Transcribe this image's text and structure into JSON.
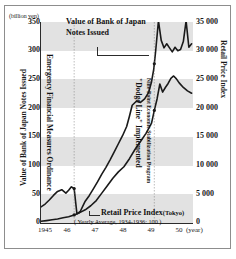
{
  "chart_data": {
    "type": "line",
    "title": "",
    "units_caption": "(billion yen)",
    "xlabel": "",
    "x_unit_label": "(year)",
    "xticks": [
      "1945",
      "46",
      "47",
      "48",
      "49",
      "50"
    ],
    "xlim": [
      1945.0,
      1950.5
    ],
    "grid": "horizontal-bands",
    "legend": "annotations-inline",
    "axes": {
      "left": {
        "title": "Value of Bank of Japan Notes Issued",
        "ticks": [
          "350",
          "300",
          "250",
          "200",
          "150",
          "100",
          "50",
          "0"
        ],
        "values": [
          350,
          300,
          250,
          200,
          150,
          100,
          50,
          0
        ],
        "lim": [
          0,
          350
        ],
        "unit": "(billion yen)"
      },
      "right": {
        "title": "Retail Price Index",
        "ticks": [
          "35 000",
          "30 000",
          "25 000",
          "20 000",
          "15 000",
          "10 000",
          "5 000",
          "0"
        ],
        "values": [
          35000,
          30000,
          25000,
          20000,
          15000,
          10000,
          5000,
          0
        ],
        "lim": [
          0,
          35000
        ]
      }
    },
    "annotations": {
      "boj_line1": "Value of Bank of Japan",
      "boj_line2": "Notes Issued",
      "emergency_ordinance": "Emergency Financial Measures Ordinance",
      "dodge_line": "\"Dodge Line\" Implemented",
      "dodge_sub": "Nine-Point Economic Stabilization Program",
      "rpi_label": "Retail Price Index",
      "rpi_city": "(Tokyo)",
      "rpi_sub": "( Yearly Average, 1934-1936: 100 )"
    },
    "series": [
      {
        "name": "Value of Bank of Japan Notes Issued",
        "axis": "left",
        "unit": "billion yen",
        "color": "#1a1a1a",
        "x": [
          1945.0,
          1945.15,
          1945.3,
          1945.45,
          1945.6,
          1945.75,
          1945.9,
          1946.0,
          1946.1,
          1946.2,
          1946.3,
          1946.42,
          1946.5,
          1946.6,
          1946.75,
          1946.9,
          1947.05,
          1947.2,
          1947.35,
          1947.5,
          1947.65,
          1947.8,
          1947.95,
          1948.1,
          1948.2,
          1948.3,
          1948.45,
          1948.6,
          1948.75,
          1948.9,
          1949.0,
          1949.08,
          1949.15,
          1949.25,
          1949.35,
          1949.45,
          1949.55,
          1949.65,
          1949.75,
          1949.85,
          1949.95,
          1950.05,
          1950.15,
          1950.25,
          1950.35,
          1950.45
        ],
        "y": [
          28,
          33,
          40,
          48,
          55,
          58,
          52,
          57,
          63,
          60,
          16,
          20,
          28,
          38,
          48,
          60,
          72,
          85,
          97,
          110,
          124,
          138,
          152,
          168,
          186,
          205,
          212,
          210,
          216,
          228,
          246,
          268,
          300,
          352,
          318,
          305,
          312,
          305,
          298,
          306,
          300,
          302,
          316,
          352,
          306,
          312
        ]
      },
      {
        "name": "Retail Price Index (Tokyo)",
        "axis": "right",
        "unit": "index, 1934-1936 = 100",
        "color": "#1a1a1a",
        "x": [
          1945.0,
          1945.2,
          1945.4,
          1945.6,
          1945.8,
          1946.0,
          1946.2,
          1946.4,
          1946.6,
          1946.8,
          1947.0,
          1947.2,
          1947.4,
          1947.6,
          1947.8,
          1948.0,
          1948.2,
          1948.4,
          1948.6,
          1948.8,
          1949.0,
          1949.1,
          1949.2,
          1949.3,
          1949.4,
          1949.5,
          1949.6,
          1949.7,
          1949.8,
          1949.9,
          1950.0,
          1950.15,
          1950.3,
          1950.45
        ],
        "y": [
          300,
          420,
          560,
          700,
          900,
          1100,
          1400,
          1800,
          2300,
          3000,
          3900,
          5200,
          6500,
          7800,
          8900,
          9800,
          11200,
          12800,
          14200,
          15600,
          17400,
          19600,
          21600,
          24200,
          22800,
          23600,
          24300,
          25200,
          25600,
          25100,
          24400,
          23600,
          23000,
          22600
        ]
      }
    ],
    "event_markers": [
      {
        "label": "Emergency Financial Measures Ordinance",
        "x": 1946.2
      },
      {
        "label": "\"Dodge Line\" Implemented",
        "x": 1949.1
      }
    ]
  }
}
